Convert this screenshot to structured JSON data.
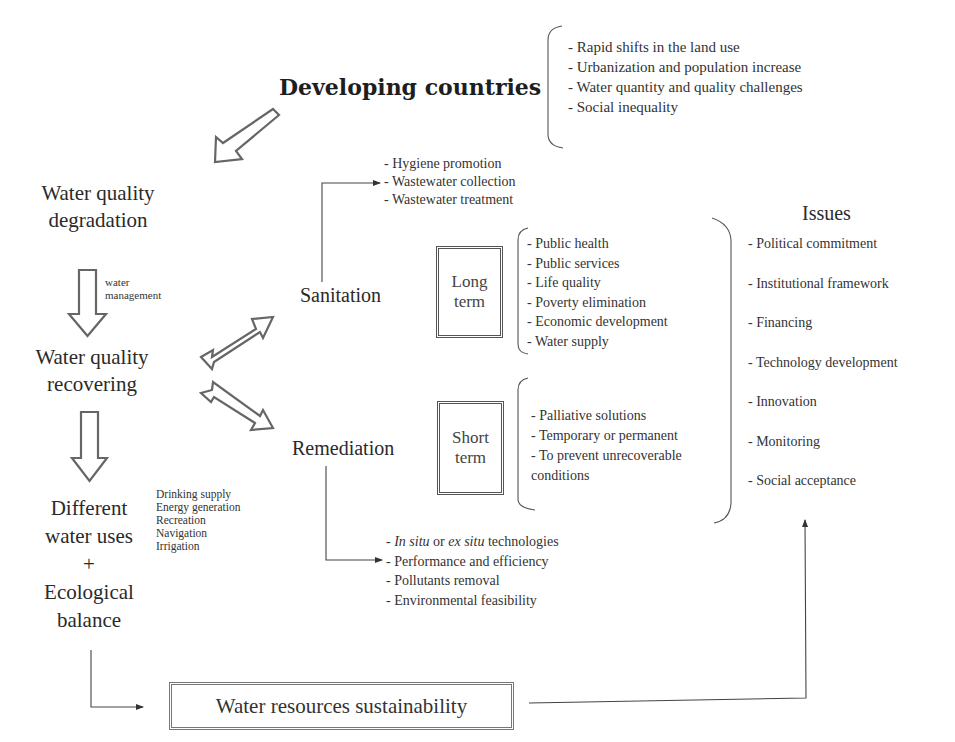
{
  "header": {
    "title": "Developing countries",
    "context_items": [
      "- Rapid shifts in the land use",
      "- Urbanization and population increase",
      "- Water quantity and quality challenges",
      "- Social inequality"
    ]
  },
  "flow": {
    "degradation": [
      "Water quality",
      "degradation"
    ],
    "management_label": [
      "water",
      "management"
    ],
    "recovering": [
      "Water quality",
      "recovering"
    ],
    "uses": [
      "Different",
      "water uses",
      "+",
      "Ecological",
      "balance"
    ],
    "uses_list": [
      "Drinking supply",
      "Energy generation",
      "Recreation",
      "Navigation",
      "Irrigation"
    ]
  },
  "sanitation": {
    "label": "Sanitation",
    "actions": [
      "- Hygiene promotion",
      "- Wastewater collection",
      "- Wastewater treatment"
    ],
    "term_line1": "Long",
    "term_line2": "term",
    "benefits": [
      "- Public health",
      "- Public services",
      "- Life quality",
      "- Poverty elimination",
      "- Economic development",
      "- Water supply"
    ]
  },
  "remediation": {
    "label": "Remediation",
    "term_line1": "Short",
    "term_line2": "term",
    "benefits": [
      "- Palliative solutions",
      "- Temporary or permanent",
      "- To prevent unrecoverable",
      "conditions"
    ],
    "actions_first": {
      "prefix": "- ",
      "italic1": "In situ",
      "middle": " or ",
      "italic2": "ex situ",
      "suffix": " technologies"
    },
    "actions": [
      "- Performance and efficiency",
      "- Pollutants removal",
      "- Environmental feasibility"
    ]
  },
  "issues": {
    "title": "Issues",
    "items": [
      "- Political commitment",
      "- Institutional framework",
      "- Financing",
      "- Technology development",
      "- Innovation",
      "- Monitoring",
      "- Social acceptance"
    ]
  },
  "sustainability": {
    "label": "Water resources sustainability"
  },
  "colors": {
    "text": "#2a2a2a",
    "line": "#444444",
    "arrow_outline": "#555555"
  }
}
